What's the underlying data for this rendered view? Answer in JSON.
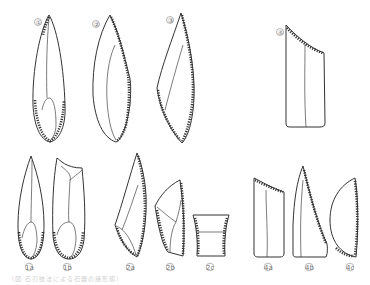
{
  "figure": {
    "type": "archaeological line drawing",
    "stroke_color": "#333333",
    "label_color": "#777777",
    "items": [
      {
        "id": "1",
        "label": "①",
        "shape": "pointed blade, retouched base"
      },
      {
        "id": "2",
        "label": "②",
        "shape": "backed crescent point"
      },
      {
        "id": "3",
        "label": "③",
        "shape": "oblique backed point"
      },
      {
        "id": "4",
        "label": "④",
        "shape": "truncated blade"
      },
      {
        "id": "1a",
        "label": "1a",
        "shape": "pointed blade, retouched base"
      },
      {
        "id": "1b",
        "label": "1b",
        "shape": "blade with truncated top"
      },
      {
        "id": "2a",
        "label": "2a",
        "shape": "oblique backed point"
      },
      {
        "id": "2b",
        "label": "2b",
        "shape": "backed segment fragment"
      },
      {
        "id": "2c",
        "label": "2c",
        "shape": "trapezoid segment"
      },
      {
        "id": "4a",
        "label": "4a",
        "shape": "obliquely truncated blade"
      },
      {
        "id": "4b",
        "label": "4b",
        "shape": "backed point"
      },
      {
        "id": "4c",
        "label": "4c",
        "shape": "lunate / half-moon"
      }
    ]
  },
  "caption": "（図 石刃技法による石器の諸形態）"
}
